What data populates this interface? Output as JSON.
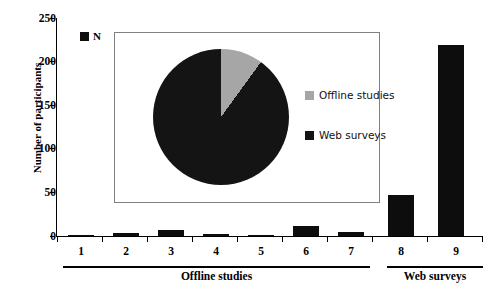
{
  "chart_data": {
    "type": "bar",
    "title": "",
    "xlabel": "",
    "ylabel": "Number of participants",
    "ylim": [
      0,
      250
    ],
    "yticks": [
      0,
      50,
      100,
      150,
      200,
      250
    ],
    "ytick_labels": [
      "0",
      "50",
      "100",
      "150",
      "200",
      "250"
    ],
    "grid": false,
    "categories": [
      "1",
      "2",
      "3",
      "4",
      "5",
      "6",
      "7",
      "8",
      "9"
    ],
    "series": [
      {
        "name": "N",
        "color": "#0d0d0d",
        "values": [
          1,
          3,
          7,
          2,
          1,
          11,
          5,
          47,
          219
        ]
      }
    ],
    "legend_position": "top-left",
    "group_labels": [
      {
        "label": "Offline studies",
        "categories": [
          "1",
          "2",
          "3",
          "4",
          "5",
          "6",
          "7"
        ]
      },
      {
        "label": "Web surveys",
        "categories": [
          "8",
          "9"
        ]
      }
    ],
    "inset": {
      "type": "pie",
      "labels": [
        "Offline studies",
        "Web surveys"
      ],
      "values": [
        10,
        90
      ],
      "colors": [
        "#a6a6a6",
        "#141414"
      ],
      "legend_position": "right"
    }
  },
  "axes": {
    "y_title": "Number of participants",
    "y_ticks": [
      "250",
      "200",
      "150",
      "100",
      "50",
      "0"
    ],
    "x_ticks": [
      "1",
      "2",
      "3",
      "4",
      "5",
      "6",
      "7",
      "8",
      "9"
    ]
  },
  "groups": {
    "offline": "Offline studies",
    "web": "Web surveys"
  },
  "series_legend": {
    "label": "N",
    "color": "#0d0d0d"
  },
  "inset_legend": {
    "offline_label": "Offline studies",
    "offline_color": "#a6a6a6",
    "web_label": "Web surveys",
    "web_color": "#141414"
  }
}
